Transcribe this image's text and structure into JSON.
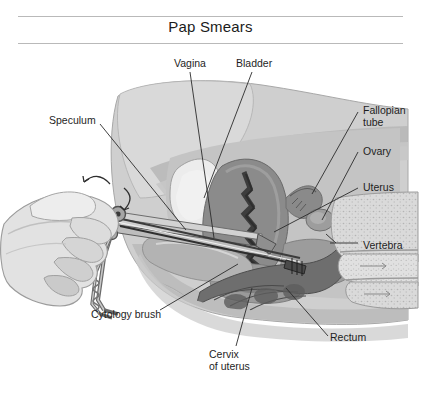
{
  "title": "Pap Smears",
  "labels": {
    "vagina": "Vagina",
    "bladder": "Bladder",
    "speculum": "Speculum",
    "fallopian_tube": "Fallopian\ntube",
    "ovary": "Ovary",
    "uterus": "Uterus",
    "vertebra": "Vertebra",
    "cytology_brush": "Cytology brush",
    "cervix_of_uterus": "Cervix\nof uterus",
    "rectum": "Rectum"
  },
  "colors": {
    "background": "#ffffff",
    "rule": "#b9b9b9",
    "text": "#1e1e1e",
    "leader_line": "#2b2b2b",
    "skin_light": "#dcdcdc",
    "skin_mid": "#c9c9c9",
    "body_fill": "#c2c2c2",
    "body_shade": "#a9a9a9",
    "organ_dark": "#7e7e7e",
    "organ_darker": "#5f5f5f",
    "cavity_light": "#efefef",
    "bone_fill": "#d7d7d7",
    "instrument": "#8e8e8e",
    "instrument_dark": "#4a4a4a"
  },
  "figure": {
    "type": "anatomical-cross-section",
    "view": "sagittal",
    "parts": [
      "female-pelvis-outline",
      "bladder",
      "vagina",
      "uterus",
      "cervix",
      "ovary",
      "fallopian-tube",
      "rectum",
      "sacrum-vertebrae",
      "vaginal-speculum",
      "cytology-brush",
      "clinician-hand"
    ]
  }
}
